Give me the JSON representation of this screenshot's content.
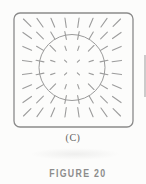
{
  "page": {
    "background": "#fcfcfb"
  },
  "figure": {
    "part_label": "(C)",
    "caption": "FIGURE 20",
    "diagram": {
      "description": "square frame containing a circle outline with a field of short dashes oriented radially outward from the center",
      "ink_color": "#9c9c9c",
      "frame_color": "#8a8a8a",
      "circle_color": "#9b9b9b",
      "frame": {
        "x": 14,
        "y": 13,
        "width": 119,
        "height": 114,
        "corner_radius": 6,
        "stroke_width": 1.3
      },
      "circle": {
        "cx": 72,
        "cy": 67.5,
        "r": 33,
        "stroke_width": 1
      },
      "dash_grid": {
        "rows": 8,
        "cols": 8,
        "spacing": 12.8,
        "center_x": 72,
        "center_y": 67.5,
        "stroke_width": 1.1,
        "length_rules": [
          {
            "max_dist": 14,
            "len": 3
          },
          {
            "max_dist": 27,
            "len": 4.5
          },
          {
            "max_dist": 40,
            "len": 8
          },
          {
            "max_dist": 52,
            "len": 9.5
          },
          {
            "max_dist": 9999,
            "len": 10.5
          }
        ]
      }
    }
  }
}
